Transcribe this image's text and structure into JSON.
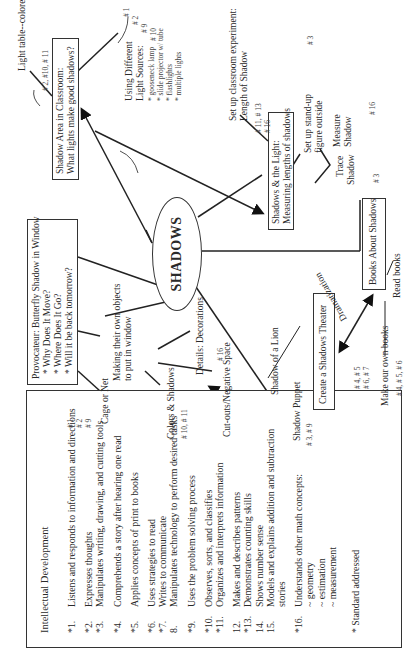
{
  "center": {
    "label": "SHADOWS"
  },
  "standards_box": {
    "title": "Intellectual Development",
    "items": [
      {
        "num": "*1.",
        "text": "Listens and responds  to information and directions"
      },
      {
        "num": "*2.",
        "text": "Expresses thoughts"
      },
      {
        "num": "*3.",
        "text": "Manipulates writing, drawing, and cutting tools"
      },
      {
        "num": "*4.",
        "text": "Comprehends a story after hearing one  read"
      },
      {
        "num": "*5.",
        "text": "Applies concepts of print to books"
      },
      {
        "num": "*6.",
        "text": "Uses strategies to read"
      },
      {
        "num": "*7.",
        "text": "Writes to communicate"
      },
      {
        "num": "8.",
        "text": "Manipulates technology to perform desired tasks"
      },
      {
        "num": "*9.",
        "text": "Uses the problem solving process"
      },
      {
        "num": "*10.",
        "text": "Observes, sorts, and classifies"
      },
      {
        "num": "*11.",
        "text": "Organizes and interprets information"
      },
      {
        "num": "12.",
        "text": "Makes and describes patterns"
      },
      {
        "num": "*13.",
        "text": "Demonstrates counting skills"
      },
      {
        "num": "14.",
        "text": "Shows number sense"
      },
      {
        "num": "15.",
        "text": "Models and explains addition and subtraction stories"
      },
      {
        "num": "*16.",
        "text": "Understands other math concepts:"
      }
    ],
    "sub_items": [
      "~ geometry",
      "~ estimation",
      "~ measurement"
    ],
    "footnote": "* Standard addressed"
  },
  "provocateur": {
    "title": "Provocateur:  Butterfly Shadow in Window",
    "bullets": [
      "* Why Does It Move?",
      "* Where Does It Go?",
      "* Will it be back tomorrow?"
    ]
  },
  "shadow_area": {
    "line1": "Shadow Area in Classroom:",
    "line2": "What lights make good shadows?",
    "note_light_table": "Light table--colored light?",
    "standards": "# 2, #10, # 11"
  },
  "light_sources": {
    "title1": "Using Different",
    "title2": "Light Sources:",
    "items": [
      "* gooseneck lamp",
      "* slide projector w/ tube",
      "* flashlights",
      "* multiple lights"
    ],
    "standards": [
      "# 1",
      "# 2",
      "# 9",
      "# 10"
    ]
  },
  "shadows_light": {
    "line1": "Shadows & the Light:",
    "line2": "Measuring lengths of shadows",
    "experiment1": "Set up classroom experiment:",
    "experiment2": "Length of Shadow",
    "experiment_standards1": "# 11, # 13",
    "experiment_standards2": "# 16",
    "standup1": "Set up stand-up",
    "standup2": "figure outside",
    "standup_standards": "# 3",
    "measure1": "Measure",
    "measure2": "Shadow",
    "measure_standards": "# 16",
    "trace1": "Trace",
    "trace2": "Shadow",
    "trace_standards": "# 3"
  },
  "books": {
    "label": "Books About Shadows",
    "read": "Read books",
    "make": "Make our own books",
    "make_standards": "# 4, # 5, # 6",
    "side_standards1": "# 4, # 5",
    "side_standards2": "# 6, # 7"
  },
  "theater": {
    "label": "Create a Shadows Theater",
    "dramatization": "Dramatization",
    "lion": "Shadow of a Lion",
    "puppet": "Shadow Puppet",
    "puppet_standards": "# 3, # 9"
  },
  "objects": {
    "line1": "Making their own objects",
    "line2": "to put in window",
    "cage": "Cage or Net",
    "cage_standards": [
      "# 1",
      "# 2",
      "# 9"
    ],
    "colors": "Colors & Shadows",
    "colors_standards": "# 10, # 11",
    "details": "Details:  Decorations",
    "details_standards": "# 16",
    "cutouts": "Cut-outs/Negative Space"
  }
}
